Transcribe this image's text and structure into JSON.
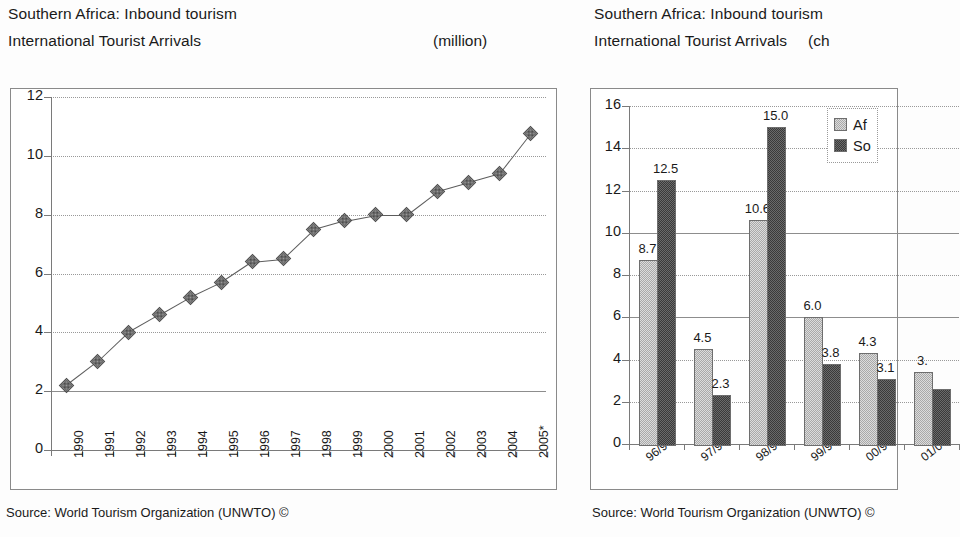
{
  "left_panel": {
    "title_line1": "Southern Africa: Inbound tourism",
    "title_line2": "International Tourist Arrivals",
    "units": "(million)",
    "source": "Source: World Tourism Organization (UNWTO) ©"
  },
  "right_panel": {
    "title_line1": "Southern Africa: Inbound tourism",
    "title_line2": "International Tourist Arrivals",
    "units": "(ch",
    "source": "Source: World Tourism Organization (UNWTO) ©"
  },
  "chart_data": [
    {
      "type": "line",
      "title": "Southern Africa: Inbound tourism — International Tourist Arrivals",
      "xlabel": "",
      "ylabel": "",
      "units": "(million)",
      "ylim": [
        0,
        12
      ],
      "ytick_step": 2,
      "yticks": [
        "0",
        "2",
        "4",
        "6",
        "8",
        "10",
        "12"
      ],
      "grid": true,
      "legend": "none",
      "categories": [
        "1990",
        "1991",
        "1992",
        "1993",
        "1994",
        "1995",
        "1996",
        "1997",
        "1998",
        "1999",
        "2000",
        "2001",
        "2002",
        "2003",
        "2004",
        "2005*"
      ],
      "values": [
        2.2,
        3.0,
        4.0,
        4.6,
        5.2,
        5.7,
        6.4,
        6.5,
        7.5,
        7.8,
        8.0,
        8.0,
        8.8,
        9.1,
        9.4,
        10.75
      ]
    },
    {
      "type": "bar",
      "title": "Southern Africa: Inbound tourism — International Tourist Arrivals",
      "xlabel": "",
      "ylabel": "",
      "units": "(ch",
      "ylim": [
        0,
        16
      ],
      "ytick_step": 2,
      "yticks": [
        "0",
        "2",
        "4",
        "6",
        "8",
        "10",
        "12",
        "14",
        "16"
      ],
      "grid": true,
      "legend_position": "top-right",
      "categories": [
        "96/95",
        "97/96",
        "98/97",
        "99/98",
        "00/99",
        "01/00"
      ],
      "series": [
        {
          "name": "Af",
          "values": [
            8.7,
            4.5,
            10.6,
            6.0,
            4.3,
            3.4
          ],
          "labels": [
            "8.7",
            "4.5",
            "10.6",
            "6.0",
            "4.3",
            "3."
          ]
        },
        {
          "name": "So",
          "values": [
            12.5,
            2.3,
            15.0,
            3.8,
            3.1,
            2.6
          ],
          "labels": [
            "12.5",
            "2.3",
            "15.0",
            "3.8",
            "3.1",
            ""
          ]
        }
      ]
    }
  ]
}
